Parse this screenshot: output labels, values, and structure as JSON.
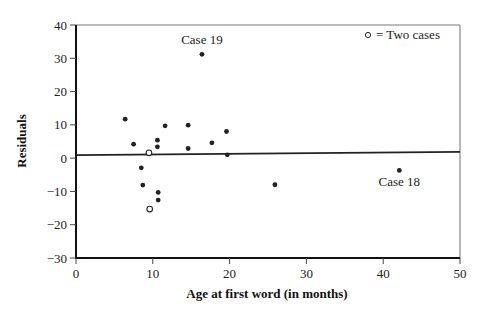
{
  "chart_data": {
    "type": "scatter",
    "title": "",
    "xlabel": "Age at first word (in months)",
    "ylabel": "Residuals",
    "xlim": [
      0,
      50
    ],
    "ylim": [
      -30,
      40
    ],
    "xticks": [
      0,
      10,
      20,
      30,
      40,
      50
    ],
    "yticks": [
      -30,
      -20,
      -10,
      0,
      10,
      20,
      30,
      40
    ],
    "xtick_labels": [
      "0",
      "10",
      "20",
      "30",
      "40",
      "50"
    ],
    "ytick_labels": [
      "−30",
      "−20",
      "−10",
      "0",
      "10",
      "20",
      "30",
      "40"
    ],
    "grid": false,
    "legend": {
      "placement": "top-right",
      "text": "= Two cases",
      "marker": "open-circle"
    },
    "series": [
      {
        "name": "single cases",
        "marker": "filled-circle",
        "points": [
          {
            "x": 6.4,
            "y": 11.7
          },
          {
            "x": 7.5,
            "y": 4.2
          },
          {
            "x": 10.6,
            "y": 5.4
          },
          {
            "x": 10.6,
            "y": 3.4
          },
          {
            "x": 11.6,
            "y": 9.7
          },
          {
            "x": 14.6,
            "y": 9.9
          },
          {
            "x": 14.6,
            "y": 2.9
          },
          {
            "x": 16.4,
            "y": 31.2
          },
          {
            "x": 17.7,
            "y": 4.6
          },
          {
            "x": 19.6,
            "y": 8.0
          },
          {
            "x": 19.7,
            "y": 1.0
          },
          {
            "x": 8.5,
            "y": -2.9
          },
          {
            "x": 8.7,
            "y": -8.1
          },
          {
            "x": 10.7,
            "y": -10.3
          },
          {
            "x": 10.7,
            "y": -12.6
          },
          {
            "x": 25.9,
            "y": -8.0
          },
          {
            "x": 42.1,
            "y": -3.7
          }
        ]
      },
      {
        "name": "two cases",
        "marker": "open-circle",
        "points": [
          {
            "x": 9.5,
            "y": 1.6
          },
          {
            "x": 9.6,
            "y": -15.3
          }
        ]
      }
    ],
    "reference_line": {
      "x": [
        0,
        50
      ],
      "y": [
        0.9,
        1.9
      ]
    },
    "annotations": [
      {
        "text": "Case 19",
        "x": 16.4,
        "y": 31.2,
        "position": "above"
      },
      {
        "text": "Case 18",
        "x": 42.1,
        "y": -3.7,
        "position": "below"
      }
    ]
  }
}
